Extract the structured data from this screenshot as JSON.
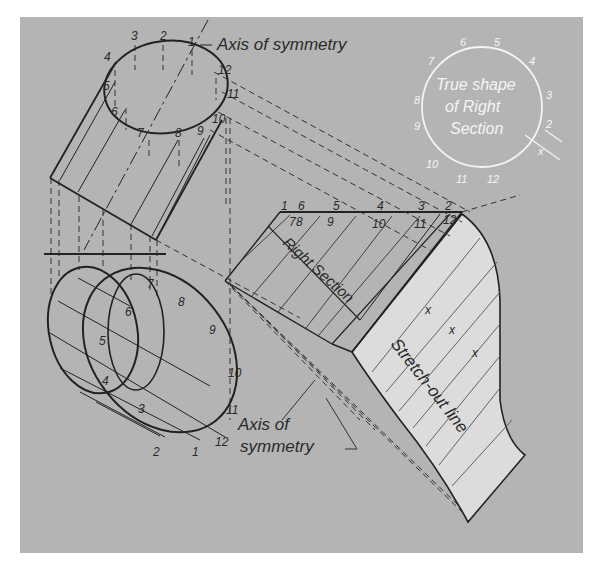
{
  "figure": {
    "background_color": "#b4b4b4",
    "line_color": "#222222",
    "development_fill": "#dcdcdc",
    "label_color_light": "#f4f4f4"
  },
  "labels": {
    "axis_top": "Axis of symmetry",
    "axis_bottom_line1": "Axis of",
    "axis_bottom_line2": "symmetry",
    "right_section": "Right Section",
    "stretch_out": "Stretch-out line",
    "true_shape_line1": "True shape",
    "true_shape_line2": "of Right",
    "true_shape_line3": "Section",
    "x_mark": "x"
  },
  "top_view_numbers": [
    "1",
    "2",
    "3",
    "4",
    "5",
    "6",
    "7",
    "8",
    "9",
    "10",
    "11",
    "12"
  ],
  "front_view_numbers": [
    "1",
    "2",
    "3",
    "4",
    "5",
    "6",
    "7",
    "8",
    "9",
    "10",
    "11",
    "12"
  ],
  "right_section_top_numbers": [
    "1",
    "6",
    "5",
    "4",
    "3",
    "2"
  ],
  "right_section_bottom_numbers": [
    "7",
    "8",
    "9",
    "10",
    "11",
    "12"
  ],
  "true_shape_numbers": [
    "1",
    "2",
    "3",
    "4",
    "5",
    "6",
    "7",
    "8",
    "9",
    "10",
    "11",
    "12"
  ],
  "stretch_out_marks": [
    "x",
    "x",
    "x"
  ]
}
